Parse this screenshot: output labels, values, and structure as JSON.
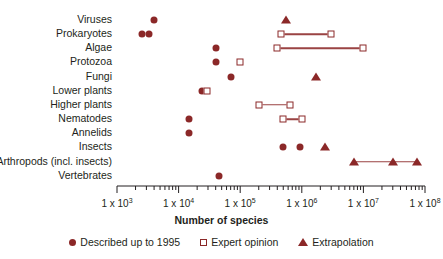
{
  "chart_data": {
    "type": "scatter",
    "title": "",
    "xlabel": "Number of species",
    "ylabel": "",
    "xscale": "log",
    "xlim": [
      1000,
      100000000
    ],
    "grid": false,
    "legend_position": "bottom",
    "tick_labels": [
      "1 x 10",
      "1 x 10",
      "1 x 10",
      "1 x 10",
      "1 x 10",
      "1 x 10"
    ],
    "tick_exponents": [
      "3",
      "4",
      "5",
      "6",
      "7",
      "8"
    ],
    "tick_values": [
      1000,
      10000,
      100000,
      1000000,
      10000000,
      100000000
    ],
    "categories": [
      "Viruses",
      "Prokaryotes",
      "Algae",
      "Protozoa",
      "Fungi",
      "Lower plants",
      "Higher plants",
      "Nematodes",
      "Annelids",
      "Insects",
      "Arthropods (incl. insects)",
      "Vertebrates"
    ],
    "series": [
      {
        "name": "Described up to 1995",
        "marker": "filled-circle",
        "color": "#8B2828",
        "points": [
          {
            "category": "Viruses",
            "value": 4000
          },
          {
            "category": "Prokaryotes",
            "value": 2500
          },
          {
            "category": "Prokaryotes",
            "value": 3300
          },
          {
            "category": "Algae",
            "value": 40000
          },
          {
            "category": "Protozoa",
            "value": 40000
          },
          {
            "category": "Fungi",
            "value": 70000
          },
          {
            "category": "Lower plants",
            "value": 24000
          },
          {
            "category": "Nematodes",
            "value": 15000
          },
          {
            "category": "Annelids",
            "value": 15000
          },
          {
            "category": "Insects",
            "value": 500000
          },
          {
            "category": "Insects",
            "value": 950000
          },
          {
            "category": "Vertebrates",
            "value": 45000
          }
        ]
      },
      {
        "name": "Expert opinion",
        "marker": "open-square",
        "color": "#8B2828",
        "points": [
          {
            "category": "Prokaryotes",
            "value": 460000
          },
          {
            "category": "Prokaryotes",
            "value": 3000000
          },
          {
            "category": "Algae",
            "value": 400000
          },
          {
            "category": "Algae",
            "value": 10000000
          },
          {
            "category": "Protozoa",
            "value": 100000
          },
          {
            "category": "Lower plants",
            "value": 29000
          },
          {
            "category": "Higher plants",
            "value": 200000
          },
          {
            "category": "Higher plants",
            "value": 650000
          },
          {
            "category": "Nematodes",
            "value": 500000
          },
          {
            "category": "Nematodes",
            "value": 1000000
          }
        ],
        "ranges": [
          {
            "category": "Prokaryotes",
            "low": 460000,
            "high": 3000000
          },
          {
            "category": "Algae",
            "low": 400000,
            "high": 10000000
          },
          {
            "category": "Higher plants",
            "low": 200000,
            "high": 650000
          },
          {
            "category": "Nematodes",
            "low": 500000,
            "high": 1000000
          }
        ]
      },
      {
        "name": "Extrapolation",
        "marker": "filled-triangle",
        "color": "#8B2828",
        "points": [
          {
            "category": "Viruses",
            "value": 550000
          },
          {
            "category": "Fungi",
            "value": 1700000
          },
          {
            "category": "Insects",
            "value": 2400000
          },
          {
            "category": "Arthropods (incl. insects)",
            "value": 7000000
          },
          {
            "category": "Arthropods (incl. insects)",
            "value": 30000000
          },
          {
            "category": "Arthropods (incl. insects)",
            "value": 75000000
          }
        ],
        "ranges": [
          {
            "category": "Arthropods (incl. insects)",
            "low": 7000000,
            "high": 75000000
          }
        ]
      }
    ],
    "legend": [
      {
        "label": "Described up to 1995",
        "marker": "filled-circle"
      },
      {
        "label": "Expert opinion",
        "marker": "open-square"
      },
      {
        "label": "Extrapolation",
        "marker": "filled-triangle"
      }
    ],
    "colors": {
      "marker": "#8B2828",
      "line": "#9A4343",
      "axis": "#231f20",
      "text": "#231f20",
      "background": "#ffffff"
    }
  }
}
